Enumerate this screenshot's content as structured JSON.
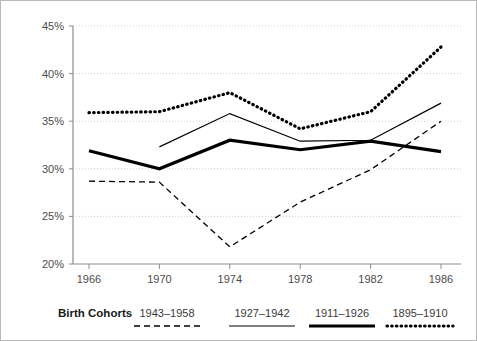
{
  "chart_data": {
    "type": "line",
    "title": "",
    "xlabel": "",
    "ylabel": "",
    "x": [
      1966,
      1970,
      1974,
      1978,
      1982,
      1986
    ],
    "xtick_labels": [
      "1966",
      "1970",
      "1974",
      "1978",
      "1982",
      "1986"
    ],
    "ytick_labels": [
      "20%",
      "25%",
      "30%",
      "35%",
      "40%",
      "45%"
    ],
    "ytick_values": [
      20,
      25,
      30,
      35,
      40,
      45
    ],
    "ylim": [
      20,
      45
    ],
    "grid": true,
    "legend_position": "bottom",
    "legend_title": "Birth Cohorts",
    "series": [
      {
        "name": "1943–1958",
        "style": "dashed",
        "values": [
          28.7,
          28.6,
          21.8,
          26.5,
          29.9,
          35.0
        ]
      },
      {
        "name": "1927–1942",
        "style": "thin-solid",
        "values": [
          null,
          32.3,
          35.8,
          32.9,
          33.0,
          36.9
        ]
      },
      {
        "name": "1911–1926",
        "style": "thick-solid",
        "values": [
          31.9,
          30.0,
          33.0,
          32.0,
          32.9,
          31.8
        ]
      },
      {
        "name": "1895–1910",
        "style": "dotted",
        "values": [
          35.9,
          36.0,
          38.0,
          34.2,
          36.0,
          42.8
        ]
      }
    ]
  },
  "legend": {
    "title": "Birth Cohorts",
    "entries": [
      {
        "label": "1943–1958",
        "style": "dashed"
      },
      {
        "label": "1927–1942",
        "style": "thin-solid"
      },
      {
        "label": "1911–1926",
        "style": "thick-solid"
      },
      {
        "label": "1895–1910",
        "style": "dotted"
      }
    ]
  },
  "colors": {
    "series": "#000000",
    "grid": "#d0d0d0",
    "axis": "#8d8d8d",
    "border": "#b9b9b9",
    "background": "#ffffff",
    "tick_text": "#4b4b4b"
  }
}
